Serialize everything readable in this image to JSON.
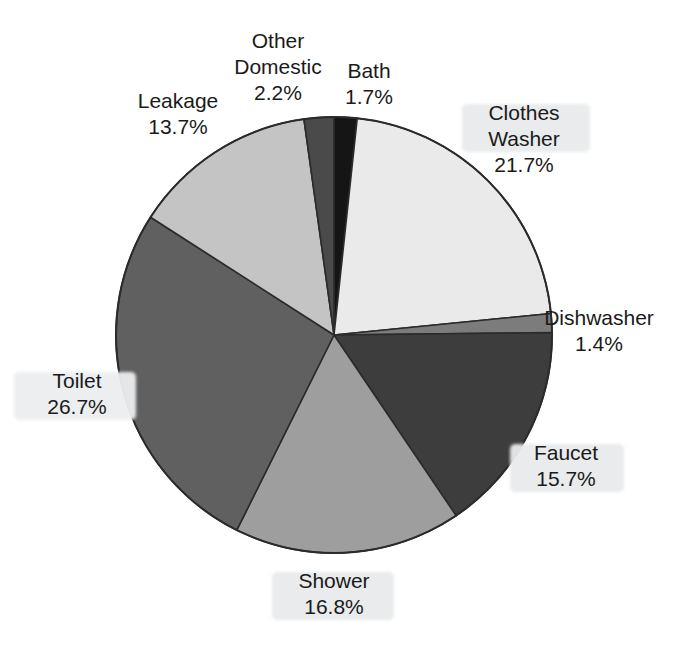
{
  "chart_data": {
    "type": "pie",
    "title": "",
    "subtitle": "",
    "xlabel": "",
    "ylabel": "",
    "legend_position": "none",
    "grid": false,
    "units": "percent",
    "categories": [
      "Bath",
      "Clothes Washer",
      "Dishwasher",
      "Faucet",
      "Shower",
      "Toilet",
      "Leakage",
      "Other Domestic"
    ],
    "values": [
      1.7,
      21.7,
      1.4,
      15.7,
      16.8,
      26.7,
      13.7,
      2.2
    ],
    "start_angle_deg": 0,
    "direction": "clockwise",
    "slices": [
      {
        "name": "Bath",
        "label": "Bath",
        "value": 1.7,
        "value_text": "1.7%",
        "color": "#151515",
        "label_lines": [
          "Bath",
          "1.7%"
        ],
        "highlight": false
      },
      {
        "name": "Clothes Washer",
        "label": "Clothes Washer",
        "value": 21.7,
        "value_text": "21.7%",
        "color": "#eaeaea",
        "label_lines": [
          "Clothes",
          "Washer",
          "21.7%"
        ],
        "highlight": true
      },
      {
        "name": "Dishwasher",
        "label": "Dishwasher",
        "value": 1.4,
        "value_text": "1.4%",
        "color": "#7c7c7c",
        "label_lines": [
          "Dishwasher",
          "1.4%"
        ],
        "highlight": false
      },
      {
        "name": "Faucet",
        "label": "Faucet",
        "value": 15.7,
        "value_text": "15.7%",
        "color": "#3d3d3d",
        "label_lines": [
          "Faucet",
          "15.7%"
        ],
        "highlight": true
      },
      {
        "name": "Shower",
        "label": "Shower",
        "value": 16.8,
        "value_text": "16.8%",
        "color": "#9e9e9e",
        "label_lines": [
          "Shower",
          "16.8%"
        ],
        "highlight": true
      },
      {
        "name": "Toilet",
        "label": "Toilet",
        "value": 26.7,
        "value_text": "26.7%",
        "color": "#606060",
        "label_lines": [
          "Toilet",
          "26.7%"
        ],
        "highlight": true
      },
      {
        "name": "Leakage",
        "label": "Leakage",
        "value": 13.7,
        "value_text": "13.7%",
        "color": "#c4c4c4",
        "label_lines": [
          "Leakage",
          "13.7%"
        ],
        "highlight": false
      },
      {
        "name": "Other Domestic",
        "label": "Other Domestic",
        "value": 2.2,
        "value_text": "2.2%",
        "color": "#4a4a4a",
        "label_lines": [
          "Other",
          "Domestic",
          "2.2%"
        ],
        "highlight": false
      }
    ],
    "geometry": {
      "center_x": 334,
      "center_y": 335,
      "radius": 218,
      "outline_color": "#2b2b2b"
    }
  },
  "labels": {
    "other_domestic": {
      "l1": "Other",
      "l2": "Domestic",
      "l3": "2.2%"
    },
    "bath": {
      "l1": "Bath",
      "l2": "1.7%"
    },
    "leakage": {
      "l1": "Leakage",
      "l2": "13.7%"
    },
    "clothes_washer": {
      "l1": "Clothes",
      "l2": "Washer",
      "l3": "21.7%"
    },
    "dishwasher": {
      "l1": "Dishwasher",
      "l2": "1.4%"
    },
    "toilet": {
      "l1": "Toilet",
      "l2": "26.7%"
    },
    "faucet": {
      "l1": "Faucet",
      "l2": "15.7%"
    },
    "shower": {
      "l1": "Shower",
      "l2": "16.8%"
    }
  }
}
